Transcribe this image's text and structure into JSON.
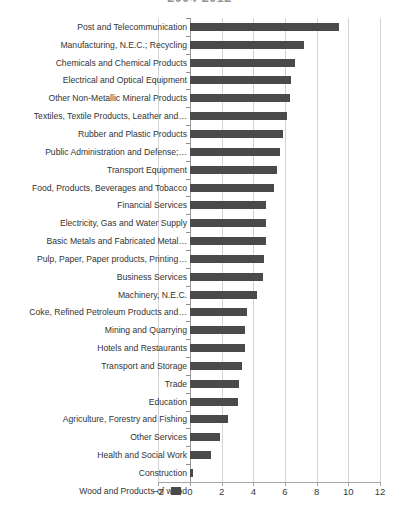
{
  "chart_data": {
    "type": "bar",
    "orientation": "horizontal",
    "title": "2004-2012",
    "xlabel": "",
    "ylabel": "",
    "xlim": [
      -2,
      12
    ],
    "xticks": [
      -2,
      0,
      2,
      4,
      6,
      8,
      10,
      12
    ],
    "grid": true,
    "legend": null,
    "bar_color": "#4a4a4a",
    "gridline_color": "#d2d2d2",
    "categories": [
      "Post and Telecommunication",
      "Manufacturing, N.E.C.; Recycling",
      "Chemicals and  Chemical Products",
      "Electrical and Optical Equipment",
      "Other Non-Metallic Mineral Products",
      "Textiles, Textile Products, Leather and…",
      "Rubber and Plastic Products",
      "Public Administration and Defense;…",
      "Transport Equipment",
      "Food, Products, Beverages and Tobacco",
      "Financial Services",
      "Electricity, Gas and Water Supply",
      "Basic Metals and Fabricated Metal…",
      "Pulp, Paper, Paper products, Printing…",
      "Business Services",
      "Machinery, N.E.C.",
      "Coke, Refined Petroleum Products and…",
      "Mining and Quarrying",
      "Hotels and Restaurants",
      "Transport and Storage",
      "Trade",
      "Education",
      "Agriculture, Forestry and Fishing",
      "Other Services",
      "Health and Social Work",
      "Construction",
      "Wood and Products of wood"
    ],
    "values": [
      9.4,
      7.2,
      6.6,
      6.4,
      6.3,
      6.1,
      5.9,
      5.7,
      5.5,
      5.3,
      4.8,
      4.8,
      4.8,
      4.7,
      4.6,
      4.2,
      3.6,
      3.5,
      3.5,
      3.3,
      3.1,
      3.0,
      2.4,
      1.9,
      1.3,
      0.15,
      -0.6
    ]
  }
}
